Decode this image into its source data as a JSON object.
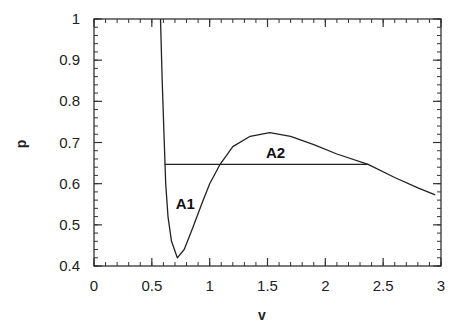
{
  "chart_data": {
    "type": "line",
    "title": "",
    "xlabel": "v",
    "ylabel": "p",
    "xlim": [
      0,
      3
    ],
    "ylim": [
      0.4,
      1
    ],
    "x_ticks": [
      0,
      0.5,
      1,
      1.5,
      2,
      2.5,
      3
    ],
    "x_tick_labels": [
      "0",
      "0.5",
      "1",
      "1.5",
      "2",
      "2.5",
      "3"
    ],
    "x_minor_step": 0.1,
    "y_ticks": [
      0.4,
      0.5,
      0.6,
      0.7,
      0.8,
      0.9,
      1
    ],
    "y_tick_labels": [
      "0.4",
      "0.5",
      "0.6",
      "0.7",
      "0.8",
      "0.9",
      "1"
    ],
    "y_minor_step": 0.02,
    "grid": false,
    "legend": null,
    "series": [
      {
        "name": "isotherm",
        "x": [
          0.575,
          0.59,
          0.605,
          0.62,
          0.64,
          0.67,
          0.72,
          0.78,
          0.85,
          0.93,
          1.0,
          1.09,
          1.2,
          1.35,
          1.52,
          1.7,
          1.9,
          2.1,
          2.37,
          2.6,
          2.8,
          2.95
        ],
        "y": [
          1.0,
          0.85,
          0.72,
          0.6,
          0.52,
          0.46,
          0.42,
          0.44,
          0.49,
          0.55,
          0.6,
          0.647,
          0.69,
          0.715,
          0.724,
          0.715,
          0.695,
          0.672,
          0.647,
          0.615,
          0.59,
          0.573
        ]
      },
      {
        "name": "equal-area line",
        "x": [
          0.61,
          2.37
        ],
        "y": [
          0.647,
          0.647
        ]
      }
    ],
    "annotations": [
      {
        "text": "A1",
        "x": 0.79,
        "y": 0.55
      },
      {
        "text": "A2",
        "x": 1.57,
        "y": 0.675
      }
    ]
  }
}
